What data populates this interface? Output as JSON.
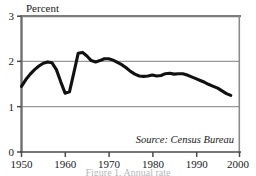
{
  "chart_data": {
    "type": "line",
    "title": "",
    "subtitle": "",
    "ylabel": "Percent",
    "xlabel": "",
    "xlim": [
      1950,
      2000
    ],
    "ylim": [
      0,
      3
    ],
    "grid": "horizontal",
    "gridlines_y": [
      1,
      2
    ],
    "legend": "none",
    "annotations": [
      {
        "name": "source-note",
        "text": "Source: Census Bureau",
        "position": "bottom-right-inside-plot",
        "style": "italic"
      }
    ],
    "y_ticks": [
      0,
      1,
      2,
      3
    ],
    "y_tick_labels": [
      "0",
      "1",
      "2",
      "3"
    ],
    "x_ticks": [
      1950,
      1960,
      1970,
      1980,
      1990,
      2000
    ],
    "x_tick_labels": [
      "1950",
      "1960",
      "1970",
      "1980",
      "1990",
      "2000"
    ],
    "line_color": "#111111",
    "line_width": 3.1,
    "x": [
      1950,
      1951,
      1952,
      1953,
      1954,
      1955,
      1956,
      1957,
      1958,
      1959,
      1960,
      1961,
      1962,
      1963,
      1964,
      1965,
      1966,
      1967,
      1968,
      1969,
      1970,
      1971,
      1972,
      1973,
      1974,
      1975,
      1976,
      1977,
      1978,
      1979,
      1980,
      1981,
      1982,
      1983,
      1984,
      1985,
      1986,
      1987,
      1988,
      1989,
      1990,
      1991,
      1992,
      1993,
      1994,
      1995,
      1996,
      1997,
      1998
    ],
    "values": [
      1.45,
      1.6,
      1.72,
      1.82,
      1.9,
      1.96,
      1.99,
      1.97,
      1.82,
      1.55,
      1.3,
      1.33,
      1.75,
      2.18,
      2.2,
      2.12,
      2.02,
      1.99,
      2.02,
      2.06,
      2.06,
      2.03,
      1.98,
      1.93,
      1.86,
      1.78,
      1.72,
      1.68,
      1.67,
      1.68,
      1.7,
      1.68,
      1.69,
      1.73,
      1.74,
      1.72,
      1.73,
      1.73,
      1.7,
      1.66,
      1.62,
      1.58,
      1.54,
      1.49,
      1.45,
      1.41,
      1.35,
      1.29,
      1.25
    ]
  },
  "figure": {
    "plot_background": "#ffffff",
    "border_color": "#8a8a8a",
    "gridline_color": "#9a9a9a",
    "clipped_caption": "Figure 1. Annual rate"
  }
}
